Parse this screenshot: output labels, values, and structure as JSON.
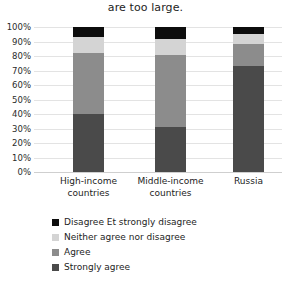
{
  "chart_data": {
    "type": "bar",
    "title": "are too large.",
    "xlabel": "",
    "ylabel": "",
    "ylim": [
      0,
      100
    ],
    "stacked": true,
    "grid": true,
    "legend_position": "bottom",
    "categories": [
      "High-income countries",
      "Middle-income countries",
      "Russia"
    ],
    "category_lines": [
      [
        "High-income",
        "countries"
      ],
      [
        "Middle-income",
        "countries"
      ],
      [
        "Russia"
      ]
    ],
    "tick_labels": [
      "100%",
      "90%",
      "80%",
      "70%",
      "60%",
      "50%",
      "40%",
      "30%",
      "20%",
      "10%",
      "0%"
    ],
    "tick_values": [
      100,
      90,
      80,
      70,
      60,
      50,
      40,
      30,
      20,
      10,
      0
    ],
    "series": [
      {
        "name": "Strongly agree",
        "color": "#4a4a4a",
        "values": [
          40,
          31,
          73
        ]
      },
      {
        "name": "Agree",
        "color": "#8c8c8c",
        "values": [
          42,
          50,
          15
        ]
      },
      {
        "name": "Neither agree nor disagree",
        "color": "#d4d4d4",
        "values": [
          11,
          11,
          7
        ]
      },
      {
        "name": "Disagree & strongly disagree",
        "color": "#0d0d0d",
        "values": [
          7,
          8,
          5
        ]
      }
    ],
    "legend_order": [
      "Disagree Et strongly disagree",
      "Neither agree nor disagree",
      "Agree",
      "Strongly agree"
    ],
    "legend_colors": [
      "#0d0d0d",
      "#d4d4d4",
      "#8c8c8c",
      "#4a4a4a"
    ]
  }
}
